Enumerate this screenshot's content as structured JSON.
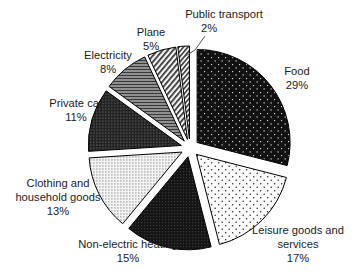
{
  "chart_data": {
    "type": "pie",
    "title": "",
    "subtitle": "",
    "xlabel": "",
    "ylabel": "",
    "legend_position": "none",
    "grid": false,
    "exploded": true,
    "start_angle_deg": 0,
    "direction": "clockwise",
    "units": "percent",
    "categories": [
      "Food",
      "Leisure goods and services",
      "Non-electric heating",
      "Clothing and household goods",
      "Private car",
      "Electricity",
      "Plane",
      "Public transport"
    ],
    "values": [
      29,
      17,
      15,
      13,
      11,
      8,
      5,
      2
    ],
    "slices": [
      {
        "label": "Food",
        "value": 29,
        "value_text": "29%",
        "fill": "#111111",
        "pattern": "black-with-white-dots",
        "label_x": 297,
        "label_y": 72,
        "pct_x": 297,
        "pct_y": 86,
        "anchor": "middle",
        "leader": false
      },
      {
        "label_line1": "Leisure goods and",
        "label_line2": "services",
        "label": "Leisure goods and services",
        "value": 17,
        "value_text": "17%",
        "fill": "#fdfdfd",
        "pattern": "white-with-black-dots",
        "label_x": 298,
        "label_y": 231,
        "label2_x": 298,
        "label2_y": 245,
        "pct_x": 298,
        "pct_y": 259,
        "anchor": "middle",
        "leader": false
      },
      {
        "label": "Non-electric heating",
        "value": 15,
        "value_text": "15%",
        "fill": "#141414",
        "pattern": "black-fine-dot",
        "label_x": 128,
        "label_y": 245,
        "pct_x": 128,
        "pct_y": 259,
        "anchor": "middle",
        "leader": false
      },
      {
        "label_line1": "Clothing and",
        "label_line2": "household goods",
        "label": "Clothing and household goods",
        "value": 13,
        "value_text": "13%",
        "fill": "#e4e4e4",
        "pattern": "light-checker-dot",
        "label_x": 58,
        "label_y": 184,
        "label2_x": 58,
        "label2_y": 198,
        "pct_x": 58,
        "pct_y": 212,
        "anchor": "middle",
        "leader": false
      },
      {
        "label": "Private car",
        "value": 11,
        "value_text": "11%",
        "fill": "#2a2a2a",
        "pattern": "dark-dot-grid",
        "label_x": 76,
        "label_y": 104,
        "pct_x": 76,
        "pct_y": 118,
        "anchor": "middle",
        "leader": false
      },
      {
        "label": "Electricity",
        "value": 8,
        "value_text": "8%",
        "fill": "#8c8c8c",
        "pattern": "gray-horizontal-lines",
        "label_x": 108,
        "label_y": 56,
        "pct_x": 108,
        "pct_y": 70,
        "anchor": "middle",
        "leader": false
      },
      {
        "label": "Plane",
        "value": 5,
        "value_text": "5%",
        "fill": "#f2f2f2",
        "pattern": "diagonal-hatch",
        "label_x": 151,
        "label_y": 33,
        "pct_x": 151,
        "pct_y": 47,
        "anchor": "middle",
        "leader": false
      },
      {
        "label": "Public transport",
        "value": 2,
        "value_text": "2%",
        "fill": "#f2f2f2",
        "pattern": "diagonal-hatch-fine",
        "label_x": 224,
        "label_y": 15,
        "pct_x": 209,
        "pct_y": 29,
        "anchor": "middle",
        "leader": true
      }
    ]
  }
}
